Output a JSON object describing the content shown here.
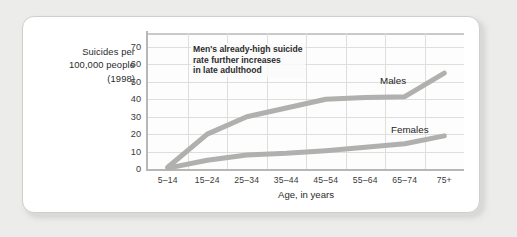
{
  "chart_data": {
    "type": "line",
    "title": "",
    "ylabel_lines": [
      "Suicides per",
      "100,000 people",
      "(1998)"
    ],
    "xlabel": "Age, in years",
    "categories": [
      "5–14",
      "15–24",
      "25–34",
      "35–44",
      "45–54",
      "55–64",
      "65–74",
      "75+"
    ],
    "yticks": [
      0,
      10,
      20,
      30,
      40,
      50,
      60,
      70
    ],
    "ylim": [
      0,
      78
    ],
    "grid": true,
    "legend_position": "inline-labels",
    "series": [
      {
        "name": "Males",
        "color": "#b0b0ae",
        "values": [
          1,
          20,
          30,
          35,
          40,
          41,
          41.5,
          55
        ]
      },
      {
        "name": "Females",
        "color": "#b0b0ae",
        "values": [
          0.5,
          5,
          8,
          9,
          10.5,
          12.5,
          14.5,
          19
        ]
      }
    ],
    "annotations": [
      {
        "name": "male-rate-annotation",
        "lines": [
          "Men's already-high suicide",
          "rate further increases",
          "in late adulthood"
        ]
      }
    ]
  },
  "colors": {
    "page_background": "#ececeb",
    "card_background": "#ffffff",
    "gridline": "#dededc",
    "axis": "#b7b7b5",
    "line": "#b0b0ae",
    "text": "#2b2b2b"
  }
}
